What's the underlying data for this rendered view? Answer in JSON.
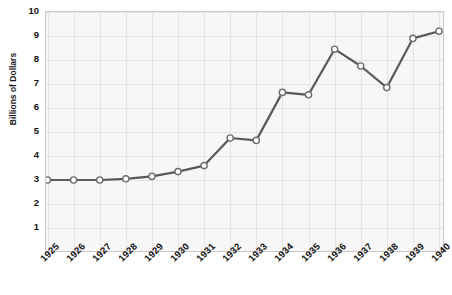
{
  "chart_data": {
    "type": "line",
    "title": "",
    "xlabel": "",
    "ylabel": "Billions of Dollars",
    "categories": [
      "1925",
      "1926",
      "1927",
      "1928",
      "1929",
      "1930",
      "1931",
      "1932",
      "1933",
      "1934",
      "1935",
      "1936",
      "1937",
      "1938",
      "1939",
      "1940"
    ],
    "values": [
      3.0,
      3.0,
      3.0,
      3.05,
      3.15,
      3.35,
      3.6,
      4.75,
      4.65,
      6.65,
      6.55,
      8.45,
      7.75,
      6.85,
      8.9,
      9.2
    ],
    "series": [
      {
        "name": "Billions of Dollars",
        "values": [
          3.0,
          3.0,
          3.0,
          3.05,
          3.15,
          3.35,
          3.6,
          4.75,
          4.65,
          6.65,
          6.55,
          8.45,
          7.75,
          6.85,
          8.9,
          9.2
        ]
      }
    ],
    "ylim": [
      0,
      10
    ],
    "yticks": [
      10,
      9,
      8,
      7,
      6,
      5,
      4,
      3,
      2,
      1
    ],
    "ytick_labels": [
      "10",
      "9",
      "8",
      "7",
      "6",
      "5",
      "4",
      "3",
      "2",
      "1"
    ],
    "xtick_labels": [
      "1925",
      "1926",
      "1927",
      "1928",
      "1929",
      "1930",
      "1931",
      "1932",
      "1933",
      "1934",
      "1935",
      "1936",
      "1937",
      "1938",
      "1939",
      "1940"
    ],
    "grid": true,
    "grid_color": "#e4e4e4",
    "legend": false,
    "legend_position": "none",
    "line_color": "#595959",
    "marker_fill": "#ffffff",
    "marker_edge": "#6e6e6e",
    "plot_background": "#f7f7f7",
    "frame_color": "#c9c9c9",
    "annotations": []
  }
}
